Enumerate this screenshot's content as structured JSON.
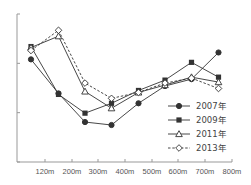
{
  "chart_data": {
    "type": "line",
    "title": "",
    "xlabel": "",
    "ylabel": "",
    "categories": [
      "~120m",
      "120m-200m",
      "200m-300m",
      "300m-400m",
      "400m-500m",
      "500m-600m",
      "600m-700m",
      "700m-800m"
    ],
    "x_tick_labels": [
      "120m",
      "200m",
      "300m",
      "400m",
      "500m",
      "600m",
      "700m",
      "800m"
    ],
    "y_ticks_count": 4,
    "ylim": [
      0,
      3
    ],
    "y_tick_labels_visible": false,
    "grid": false,
    "legend_position": "lower-right inside",
    "series": [
      {
        "name": "2007年",
        "marker": "filled-circle",
        "line": "solid",
        "values": [
          2.08,
          1.39,
          0.81,
          0.75,
          1.19,
          1.54,
          1.68,
          2.22
        ]
      },
      {
        "name": "2009年",
        "marker": "filled-square",
        "line": "solid",
        "values": [
          2.34,
          1.37,
          0.99,
          1.19,
          1.45,
          1.66,
          2.02,
          1.72
        ]
      },
      {
        "name": "2011年",
        "marker": "open-triangle",
        "line": "solid",
        "values": [
          2.32,
          2.55,
          1.43,
          1.09,
          1.41,
          1.56,
          1.72,
          1.62
        ]
      },
      {
        "name": "2013年",
        "marker": "open-diamond",
        "line": "dashed",
        "values": [
          2.26,
          2.67,
          1.6,
          1.29,
          1.41,
          1.6,
          1.7,
          1.49
        ]
      }
    ]
  },
  "colors": {
    "axis": "#999999",
    "line": "#333333",
    "text": "#555555"
  }
}
